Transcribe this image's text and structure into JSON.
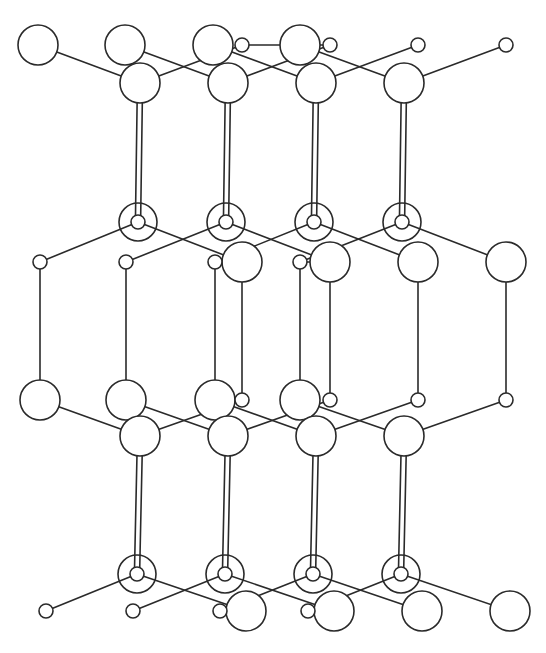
{
  "figure": {
    "width": 546,
    "height": 653,
    "colors": {
      "stroke": "#2a2a2a",
      "fill": "#ffffff",
      "background": "#ffffff"
    },
    "radii": {
      "large": 20,
      "small": 7,
      "ring_outer": 19,
      "ring_inner": 7
    },
    "period_x": 88
  },
  "atoms": {
    "large": [
      [
        38,
        45
      ],
      [
        125,
        45
      ],
      [
        213,
        45
      ],
      [
        300,
        45
      ],
      [
        140,
        83
      ],
      [
        228,
        83
      ],
      [
        316,
        83
      ],
      [
        404,
        83
      ],
      [
        242,
        262
      ],
      [
        330,
        262
      ],
      [
        418,
        262
      ],
      [
        506,
        262
      ],
      [
        40,
        400
      ],
      [
        126,
        400
      ],
      [
        215,
        400
      ],
      [
        300,
        400
      ],
      [
        140,
        436
      ],
      [
        228,
        436
      ],
      [
        316,
        436
      ],
      [
        404,
        436
      ],
      [
        246,
        611
      ],
      [
        334,
        611
      ],
      [
        422,
        611
      ],
      [
        510,
        611
      ]
    ],
    "small": [
      [
        242,
        45
      ],
      [
        330,
        45
      ],
      [
        418,
        45
      ],
      [
        506,
        45
      ],
      [
        40,
        262
      ],
      [
        126,
        262
      ],
      [
        215,
        262
      ],
      [
        300,
        262
      ],
      [
        242,
        400
      ],
      [
        330,
        400
      ],
      [
        418,
        400
      ],
      [
        506,
        400
      ],
      [
        46,
        611
      ],
      [
        133,
        611
      ],
      [
        220,
        611
      ],
      [
        308,
        611
      ]
    ],
    "ringed": [
      [
        138,
        222
      ],
      [
        226,
        222
      ],
      [
        314,
        222
      ],
      [
        402,
        222
      ],
      [
        137,
        574
      ],
      [
        225,
        574
      ],
      [
        313,
        574
      ],
      [
        401,
        574
      ]
    ]
  },
  "bonds": {
    "single": [
      [
        38,
        45,
        140,
        83
      ],
      [
        125,
        45,
        228,
        83
      ],
      [
        213,
        45,
        316,
        83
      ],
      [
        300,
        45,
        404,
        83
      ],
      [
        242,
        45,
        140,
        83
      ],
      [
        330,
        45,
        228,
        83
      ],
      [
        418,
        45,
        316,
        83
      ],
      [
        506,
        45,
        404,
        83
      ],
      [
        242,
        45,
        330,
        45
      ],
      [
        138,
        222,
        40,
        262
      ],
      [
        226,
        222,
        126,
        262
      ],
      [
        314,
        222,
        215,
        262
      ],
      [
        402,
        222,
        300,
        262
      ],
      [
        138,
        222,
        242,
        262
      ],
      [
        226,
        222,
        330,
        262
      ],
      [
        314,
        222,
        418,
        262
      ],
      [
        402,
        222,
        506,
        262
      ],
      [
        215,
        262,
        242,
        262
      ],
      [
        300,
        262,
        330,
        262
      ],
      [
        40,
        262,
        40,
        400
      ],
      [
        126,
        262,
        126,
        400
      ],
      [
        215,
        262,
        215,
        400
      ],
      [
        300,
        262,
        300,
        400
      ],
      [
        242,
        262,
        242,
        400
      ],
      [
        330,
        262,
        330,
        400
      ],
      [
        418,
        262,
        418,
        400
      ],
      [
        506,
        262,
        506,
        400
      ],
      [
        40,
        400,
        140,
        436
      ],
      [
        126,
        400,
        228,
        436
      ],
      [
        215,
        400,
        316,
        436
      ],
      [
        300,
        400,
        404,
        436
      ],
      [
        242,
        400,
        140,
        436
      ],
      [
        330,
        400,
        228,
        436
      ],
      [
        418,
        400,
        316,
        436
      ],
      [
        506,
        400,
        404,
        436
      ],
      [
        137,
        574,
        46,
        611
      ],
      [
        225,
        574,
        133,
        611
      ],
      [
        313,
        574,
        220,
        611
      ],
      [
        401,
        574,
        308,
        611
      ],
      [
        137,
        574,
        246,
        611
      ],
      [
        225,
        574,
        334,
        611
      ],
      [
        313,
        574,
        422,
        611
      ],
      [
        401,
        574,
        510,
        611
      ],
      [
        220,
        611,
        246,
        611
      ],
      [
        308,
        611,
        334,
        611
      ]
    ],
    "double": [
      [
        140,
        83,
        138,
        222
      ],
      [
        228,
        83,
        226,
        222
      ],
      [
        316,
        83,
        314,
        222
      ],
      [
        404,
        83,
        402,
        222
      ],
      [
        140,
        436,
        137,
        574
      ],
      [
        228,
        436,
        225,
        574
      ],
      [
        316,
        436,
        313,
        574
      ],
      [
        404,
        436,
        401,
        574
      ]
    ]
  }
}
